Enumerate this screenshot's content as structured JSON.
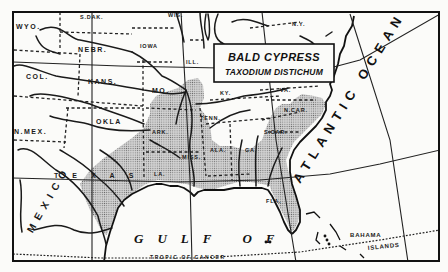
{
  "map": {
    "title": "BALD CYPRESS",
    "subtitle": "TAXODIUM DISTICHUM",
    "range_fill_color": "#b8b8b8",
    "line_color": "#1a1a1a",
    "paper_color": "#fbfbf9",
    "states": {
      "wyo": "WYO.",
      "sdak": "S.DAK.",
      "wis": "WIS.",
      "nebr": "NEBR.",
      "iowa": "IOWA",
      "ill": "ILL.",
      "col": "COL.",
      "kans": "KANS.",
      "mo": "MO.",
      "ky": "KY.",
      "va": "VA.",
      "nmex": "N.MEX.",
      "okla": "OKLA",
      "tenn": "TENN.",
      "ncar": "N.CAR.",
      "scar": "S.CAR.",
      "ark": "ARK.",
      "miss": "MISS.",
      "ala": "ALA.",
      "ga": "GA.",
      "texas": "TEXAS",
      "la": "LA.",
      "fla": "FLA.",
      "ny": "N.Y.",
      "mexico": "MEXICO"
    },
    "water": {
      "atlantic": "ATLANTIC OCEAN",
      "gulf": "GULF OF",
      "tropic": "TROPIC OF CANCER",
      "bahama": "BAHAMA",
      "islands": "ISLANDS"
    }
  }
}
